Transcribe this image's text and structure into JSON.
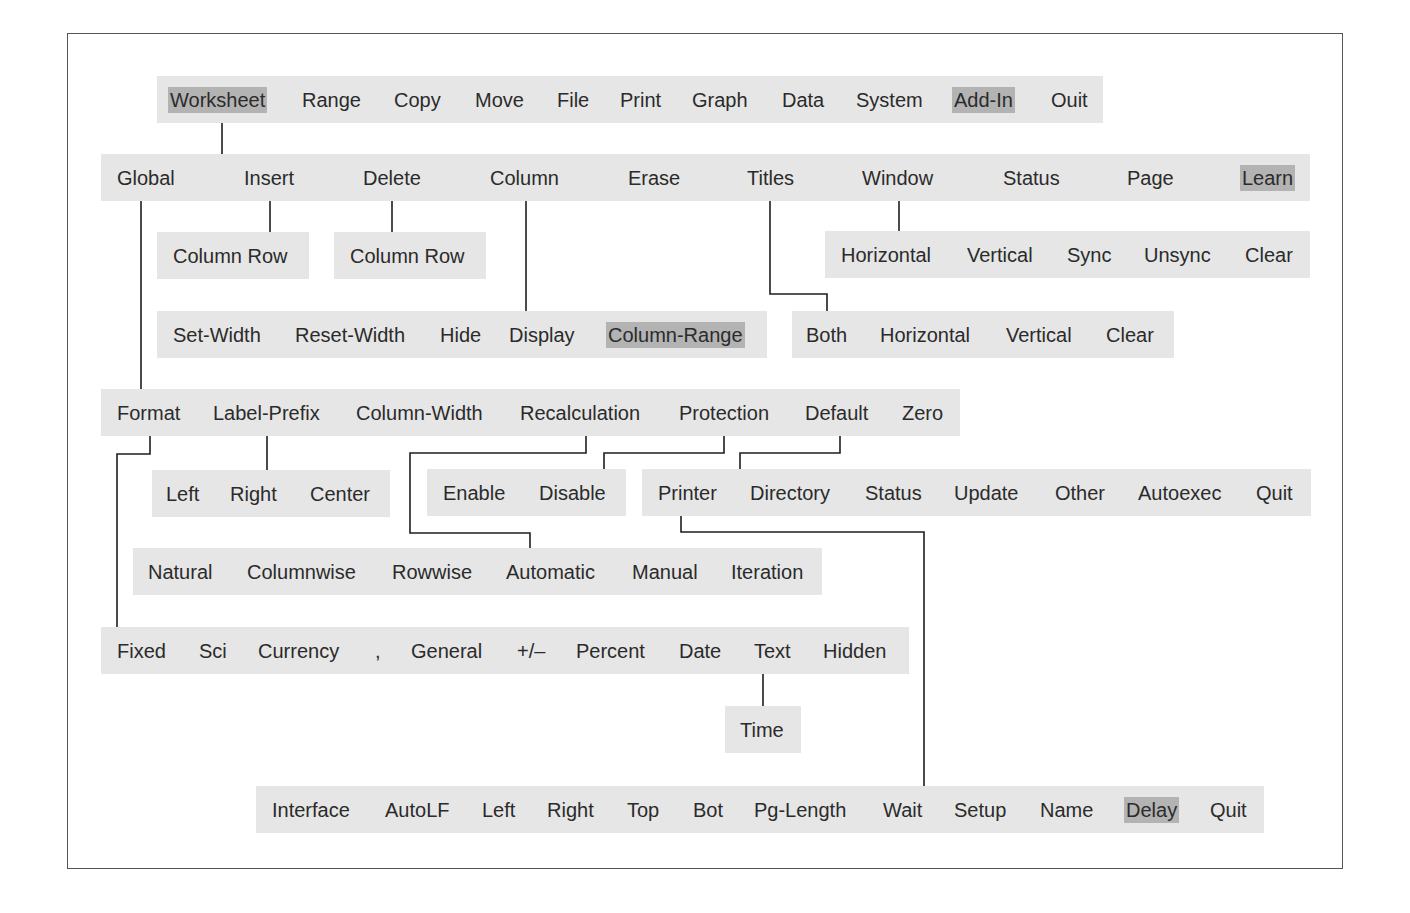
{
  "colors": {
    "bar_background": "#e6e6e6",
    "highlight": "#b3b3b3",
    "line": "#1e1e1e",
    "frame": "#555555"
  },
  "menus": {
    "main": {
      "items": [
        "Worksheet",
        "Range",
        "Copy",
        "Move",
        "File",
        "Print",
        "Graph",
        "Data",
        "System",
        "Add-In",
        "Ouit"
      ],
      "highlighted": [
        "Worksheet",
        "Add-In"
      ]
    },
    "worksheet": {
      "items": [
        "Global",
        "Insert",
        "Delete",
        "Column",
        "Erase",
        "Titles",
        "Window",
        "Status",
        "Page",
        "Learn"
      ],
      "highlighted": [
        "Learn"
      ]
    },
    "insert": {
      "items": [
        "Column Row"
      ]
    },
    "delete": {
      "items": [
        "Column Row"
      ]
    },
    "window": {
      "items": [
        "Horizontal",
        "Vertical",
        "Sync",
        "Unsync",
        "Clear"
      ]
    },
    "column": {
      "items": [
        "Set-Width",
        "Reset-Width",
        "Hide",
        "Display",
        "Column-Range"
      ],
      "highlighted": [
        "Column-Range"
      ]
    },
    "titles": {
      "items": [
        "Both",
        "Horizontal",
        "Vertical",
        "Clear"
      ]
    },
    "global": {
      "items": [
        "Format",
        "Label-Prefix",
        "Column-Width",
        "Recalculation",
        "Protection",
        "Default",
        "Zero"
      ]
    },
    "label_prefix": {
      "items": [
        "Left",
        "Right",
        "Center"
      ]
    },
    "protection": {
      "items": [
        "Enable",
        "Disable"
      ]
    },
    "default": {
      "items": [
        "Printer",
        "Directory",
        "Status",
        "Update",
        "Other",
        "Autoexec",
        "Quit"
      ]
    },
    "recalculation": {
      "items": [
        "Natural",
        "Columnwise",
        "Rowwise",
        "Automatic",
        "Manual",
        "Iteration"
      ]
    },
    "format": {
      "items": [
        "Fixed",
        "Sci",
        "Currency",
        ",",
        "General",
        "+/–",
        "Percent",
        "Date",
        "Text",
        "Hidden"
      ]
    },
    "text": {
      "items": [
        "Time"
      ]
    },
    "printer": {
      "items": [
        "Interface",
        "AutoLF",
        "Left",
        "Right",
        "Top",
        "Bot",
        "Pg-Length",
        "Wait",
        "Setup",
        "Name",
        "Delay",
        "Quit"
      ],
      "highlighted": [
        "Delay"
      ]
    }
  }
}
